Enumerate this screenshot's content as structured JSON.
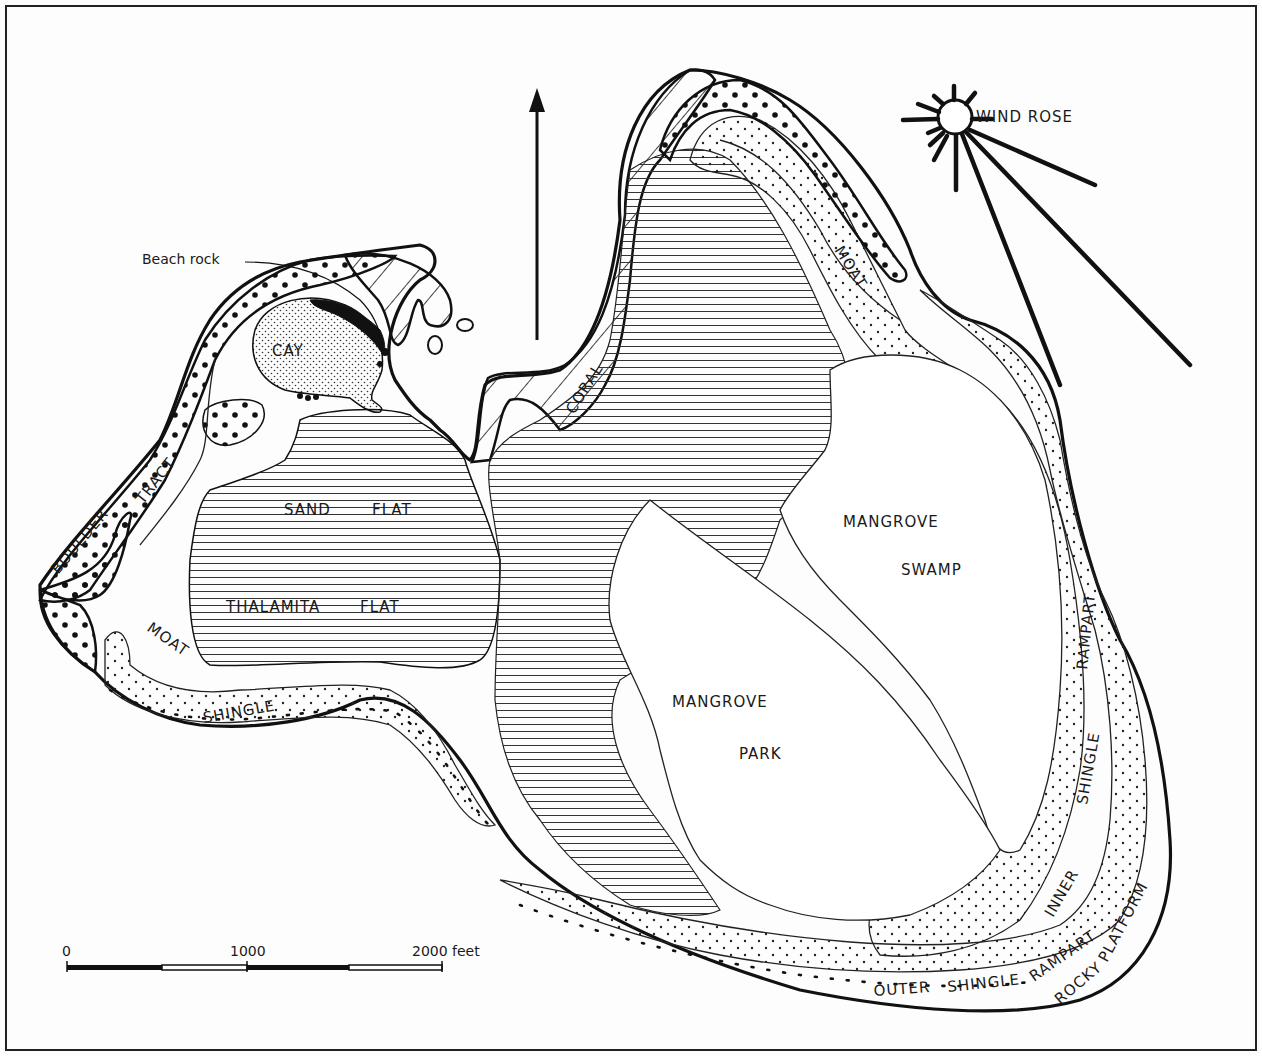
{
  "map": {
    "title": "",
    "background_color": "#fdfdfd",
    "ink_color": "#111111",
    "north_arrow": {
      "icon": "north-arrow-icon"
    },
    "wind_rose": {
      "label": "WIND ROSE",
      "icon": "wind-rose-icon"
    },
    "callouts": {
      "beach_rock": "Beach rock"
    },
    "zones": {
      "cay": "CAY",
      "boulder": "BOULDER",
      "tract": "TRACT",
      "moat_west": "MOAT",
      "moat_north": "MOAT",
      "shingle_west": "SHINGLE",
      "sand": "SAND",
      "sand_flat": "FLAT",
      "thalamita": "THALAMITA",
      "thalamita_flat": "FLAT",
      "coral": "CORAL",
      "mangrove_swamp_1": "MANGROVE",
      "mangrove_swamp_2": "SWAMP",
      "mangrove_park_1": "MANGROVE",
      "mangrove_park_2": "PARK",
      "rampart_inner": "RAMPART",
      "shingle_inner": "SHINGLE",
      "inner": "INNER",
      "outer": "OUTER",
      "shingle_outer": "SHINGLE",
      "rampart_outer": "RAMPART",
      "rocky": "ROCKY",
      "platform": "PLATFORM"
    },
    "scale_bar": {
      "tick_0": "0",
      "tick_1000": "1000",
      "tick_2000": "2000 feet",
      "units": "feet",
      "max_value": 2000
    }
  }
}
